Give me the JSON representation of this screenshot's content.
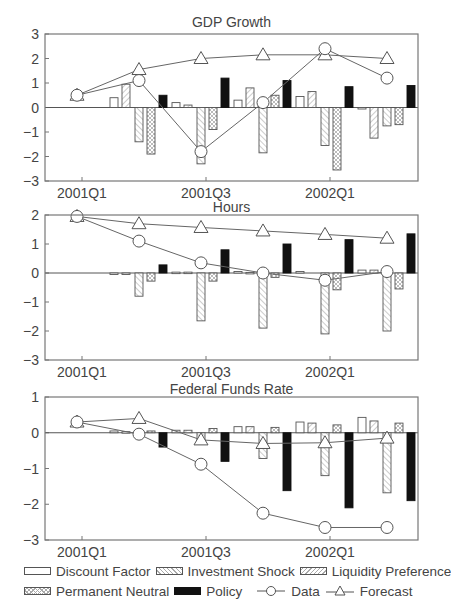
{
  "chart_data": [
    {
      "type": "bar+line",
      "title": "GDP Growth",
      "categories": [
        "2001Q1",
        "2001Q2",
        "2001Q3",
        "2001Q4",
        "2002Q1",
        "2002Q2"
      ],
      "xticks": [
        "2001Q1",
        "2001Q3",
        "2002Q1"
      ],
      "ylim": [
        -3,
        3
      ],
      "yticks": [
        3,
        2,
        1,
        0,
        -1,
        -2,
        -3
      ],
      "series": [
        {
          "name": "Discount Factor",
          "kind": "bar",
          "values": [
            0,
            0.4,
            0.2,
            0.3,
            0.45,
            -0.05
          ]
        },
        {
          "name": "Investment Shock",
          "kind": "bar",
          "values": [
            0,
            0.95,
            0.1,
            0.8,
            0.65,
            -1.25
          ]
        },
        {
          "name": "Liquidity Preference",
          "kind": "bar",
          "values": [
            0,
            -1.4,
            -2.3,
            -1.85,
            -1.55,
            -0.75
          ]
        },
        {
          "name": "Permanent Neutral",
          "kind": "bar",
          "values": [
            0,
            -1.9,
            -0.9,
            0.5,
            -2.55,
            -0.7
          ]
        },
        {
          "name": "Policy",
          "kind": "bar",
          "values": [
            0,
            0.5,
            1.2,
            1.1,
            0.85,
            0.9
          ]
        },
        {
          "name": "Data",
          "kind": "line",
          "marker": "circle",
          "values": [
            0.5,
            1.1,
            -1.8,
            0.2,
            2.4,
            1.2
          ]
        },
        {
          "name": "Forecast",
          "kind": "line",
          "marker": "triangle",
          "values": [
            0.5,
            1.55,
            2.0,
            2.15,
            2.15,
            2.0
          ]
        }
      ]
    },
    {
      "type": "bar+line",
      "title": "Hours",
      "categories": [
        "2001Q1",
        "2001Q2",
        "2001Q3",
        "2001Q4",
        "2002Q1",
        "2002Q2"
      ],
      "xticks": [
        "2001Q1",
        "2001Q3",
        "2002Q1"
      ],
      "ylim": [
        -3,
        2
      ],
      "yticks": [
        2,
        1,
        0,
        -1,
        -2,
        -3
      ],
      "series": [
        {
          "name": "Discount Factor",
          "kind": "bar",
          "values": [
            0,
            -0.01,
            0.03,
            0.05,
            0.05,
            0.1
          ]
        },
        {
          "name": "Investment Shock",
          "kind": "bar",
          "values": [
            0,
            -0.05,
            0.03,
            0.02,
            0.0,
            0.1
          ]
        },
        {
          "name": "Liquidity Preference",
          "kind": "bar",
          "values": [
            0,
            -0.8,
            -1.65,
            -1.9,
            -2.1,
            -2.0
          ]
        },
        {
          "name": "Permanent Neutral",
          "kind": "bar",
          "values": [
            0,
            -0.28,
            -0.28,
            -0.15,
            -0.58,
            -0.55
          ]
        },
        {
          "name": "Policy",
          "kind": "bar",
          "values": [
            0,
            0.28,
            0.8,
            1.0,
            1.15,
            1.35
          ]
        },
        {
          "name": "Data",
          "kind": "line",
          "marker": "circle",
          "values": [
            1.95,
            1.1,
            0.35,
            0.0,
            -0.25,
            0.05
          ]
        },
        {
          "name": "Forecast",
          "kind": "line",
          "marker": "triangle",
          "values": [
            1.95,
            1.7,
            1.57,
            1.45,
            1.33,
            1.2
          ]
        }
      ]
    },
    {
      "type": "bar+line",
      "title": "Federal Funds Rate",
      "categories": [
        "2001Q1",
        "2001Q2",
        "2001Q3",
        "2001Q4",
        "2002Q1",
        "2002Q2"
      ],
      "xticks": [
        "2001Q1",
        "2001Q3",
        "2002Q1"
      ],
      "ylim": [
        -3,
        1
      ],
      "yticks": [
        1,
        0,
        -1,
        -2,
        -3
      ],
      "series": [
        {
          "name": "Discount Factor",
          "kind": "bar",
          "values": [
            0,
            0.05,
            0.07,
            0.17,
            0.3,
            0.43
          ]
        },
        {
          "name": "Investment Shock",
          "kind": "bar",
          "values": [
            0,
            0.03,
            0.07,
            0.17,
            0.27,
            0.33
          ]
        },
        {
          "name": "Liquidity Preference",
          "kind": "bar",
          "values": [
            0,
            0.02,
            -0.3,
            -0.72,
            -1.2,
            -1.68
          ]
        },
        {
          "name": "Permanent Neutral",
          "kind": "bar",
          "values": [
            0,
            0.05,
            0.12,
            0.15,
            0.22,
            0.27
          ]
        },
        {
          "name": "Policy",
          "kind": "bar",
          "values": [
            0,
            -0.4,
            -0.8,
            -1.62,
            -2.1,
            -1.9
          ]
        },
        {
          "name": "Data",
          "kind": "line",
          "marker": "circle",
          "values": [
            0.3,
            -0.04,
            -0.88,
            -2.25,
            -2.65,
            -2.65
          ]
        },
        {
          "name": "Forecast",
          "kind": "line",
          "marker": "triangle",
          "values": [
            0.3,
            0.4,
            -0.2,
            -0.3,
            -0.28,
            -0.15
          ]
        }
      ]
    }
  ],
  "legend": {
    "row1": [
      {
        "key": "discount",
        "label": "Discount Factor"
      },
      {
        "key": "investment",
        "label": "Investment Shock"
      },
      {
        "key": "liquidity",
        "label": "Liquidity Preference"
      }
    ],
    "row2": [
      {
        "key": "permanent",
        "label": "Permanent Neutral"
      },
      {
        "key": "policy",
        "label": "Policy"
      },
      {
        "key": "data",
        "label": "Data"
      },
      {
        "key": "forecast",
        "label": "Forecast"
      }
    ]
  },
  "colors": {
    "frame": "#777777",
    "text": "#444444",
    "line": "#666666",
    "policy": "#111111",
    "hatch": "#aaaaaa"
  }
}
